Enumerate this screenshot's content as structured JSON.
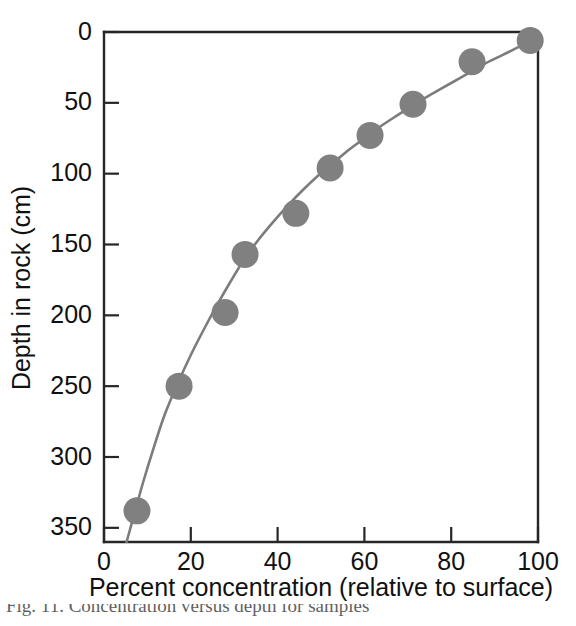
{
  "figure": {
    "background_color": "#ffffff",
    "axis_color": "#262626",
    "marker_color": "#808080",
    "curve_color": "#7c7c7c"
  },
  "caption": {
    "text": "Fig. 11. Concentration versus depth for samples"
  },
  "chart_data": {
    "type": "scatter",
    "title": "",
    "xlabel": "Percent concentration (relative to surface)",
    "ylabel": "Depth in rock (cm)",
    "xlim": [
      0,
      100
    ],
    "ylim": [
      360,
      0
    ],
    "y_inverted": true,
    "grid": false,
    "legend": null,
    "xticks": [
      0,
      20,
      40,
      60,
      80,
      100
    ],
    "xtick_labels": [
      "0",
      "20",
      "40",
      "60",
      "80",
      "100"
    ],
    "yticks": [
      0,
      50,
      100,
      150,
      200,
      250,
      300,
      350
    ],
    "ytick_labels": [
      "0",
      "50",
      "100",
      "150",
      "200",
      "250",
      "300",
      "350"
    ],
    "tick_direction": "in",
    "x": [
      7.6,
      17.3,
      27.9,
      32.5,
      44.2,
      52.1,
      61.3,
      71.2,
      84.8,
      98.2
    ],
    "y": [
      338,
      250,
      198,
      157,
      128,
      96,
      73,
      51,
      21,
      6
    ],
    "point_labels": [
      "7.6% at 338 cm",
      "17.3% at 250 cm",
      "27.9% at 198 cm",
      "32.5% at 157 cm",
      "44.2% at 128 cm",
      "52.1% at 96 cm",
      "61.3% at 73 cm",
      "71.2% at 51 cm",
      "84.8% at 21 cm",
      "98.2% at 6 cm"
    ],
    "fit_curve": {
      "label": "fitted concentration-depth curve",
      "x": [
        5.2,
        7.0,
        9.0,
        11.5,
        14.0,
        17.0,
        20.0,
        23.0,
        26.0,
        29.0,
        32.0,
        35.5,
        39.0,
        42.5,
        46.0,
        49.5,
        53.0,
        56.5,
        60.0,
        64.0,
        68.0,
        72.0,
        76.0,
        80.0,
        84.0,
        88.0,
        92.0,
        96.0,
        99.5
      ],
      "y": [
        360,
        340,
        318,
        293,
        270,
        248,
        228,
        210,
        193,
        177,
        162,
        147,
        134,
        122,
        111,
        101,
        92,
        83,
        75,
        66,
        58,
        50,
        43,
        36,
        29,
        22,
        16,
        10,
        5
      ]
    }
  }
}
